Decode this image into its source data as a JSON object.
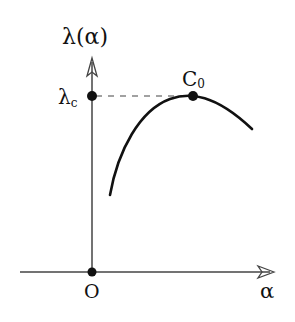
{
  "diagram": {
    "type": "function-curve",
    "y_axis": {
      "label": "λ(α)"
    },
    "x_axis": {
      "label": "α"
    },
    "origin": {
      "label": "O"
    },
    "critical_value": {
      "label_main": "λ",
      "label_sub": "c"
    },
    "max_point": {
      "label_main": "C",
      "label_sub": "0"
    },
    "colors": {
      "ink": "#111111",
      "axis": "#444444",
      "background": "#ffffff"
    }
  }
}
